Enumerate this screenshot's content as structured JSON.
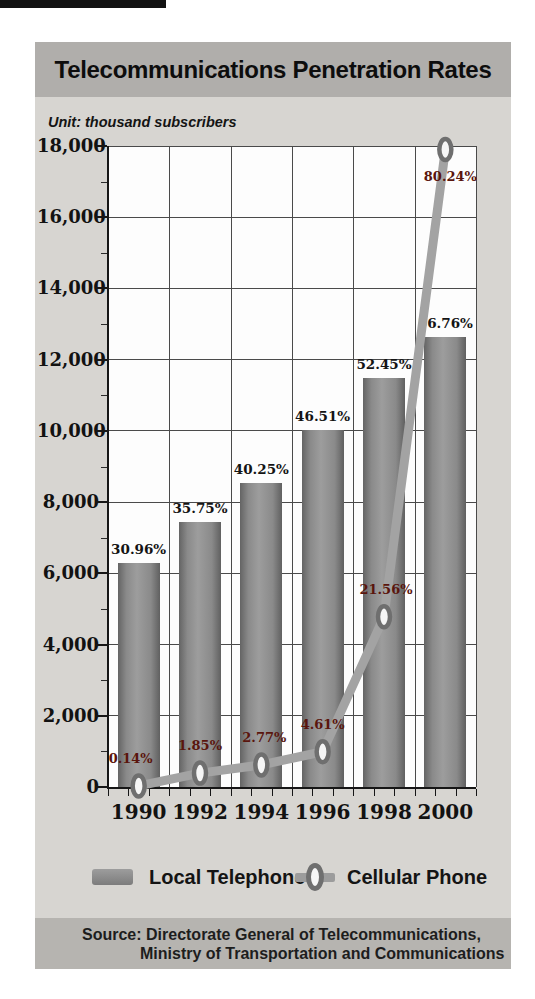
{
  "page": {
    "title": "Telecommunications Penetration Rates",
    "unit_label": "Unit: thousand subscribers",
    "source_line1": "Source: Directorate General of Telecommunications,",
    "source_line2": "Ministry of Transportation and Communications"
  },
  "legend": {
    "items": [
      {
        "label": "Local Telephone",
        "swatch": "bar-swatch"
      },
      {
        "label": "Cellular Phone",
        "swatch": "line-ring-swatch"
      }
    ],
    "position": "bottom"
  },
  "colors": {
    "card_bg": "#d7d5d1",
    "title_band_bg": "#b0aeab",
    "source_band_bg": "#b6b4b0",
    "plot_bg": "#fdfdfd",
    "grid": "#4a4a4a",
    "axis": "#161616",
    "bar_gray": "#8a8a8a",
    "line_gray": "#a3a3a3",
    "ring_stroke": "#6f6f6f",
    "ring_fill": "#f6f6f6",
    "bar_label_color": "#141414",
    "cellular_label_color": "#5a150d"
  },
  "chart_data": {
    "type": "bar",
    "title": "Telecommunications Penetration Rates",
    "ylabel": "Unit: thousand subscribers",
    "xlabel": "",
    "categories": [
      "1990",
      "1992",
      "1994",
      "1996",
      "1998",
      "2000"
    ],
    "series": [
      {
        "name": "Local Telephone",
        "type": "bar",
        "values": [
          6300,
          7450,
          8550,
          10030,
          11490,
          12640
        ],
        "labels": [
          "30.96%",
          "35.75%",
          "40.25%",
          "46.51%",
          "52.45%",
          "56.76%"
        ]
      },
      {
        "name": "Cellular Phone",
        "type": "line",
        "values": [
          30,
          390,
          620,
          990,
          4780,
          17900
        ],
        "labels": [
          "0.14%",
          "1.85%",
          "2.77%",
          "4.61%",
          "21.56%",
          "80.24%"
        ],
        "label_positions": [
          "above",
          "above",
          "above",
          "above",
          "above",
          "below"
        ],
        "label_dx": [
          -8,
          0,
          3,
          0,
          2,
          5
        ]
      }
    ],
    "ylim": [
      0,
      18000
    ],
    "ytick_step": 2000,
    "ytick_minor_step": 1000,
    "ytick_labels": [
      "0",
      "2,000",
      "4,000",
      "6,000",
      "8,000",
      "10,000",
      "12,000",
      "14,000",
      "16,000",
      "18,000"
    ],
    "grid": true,
    "legend_position": "bottom"
  }
}
